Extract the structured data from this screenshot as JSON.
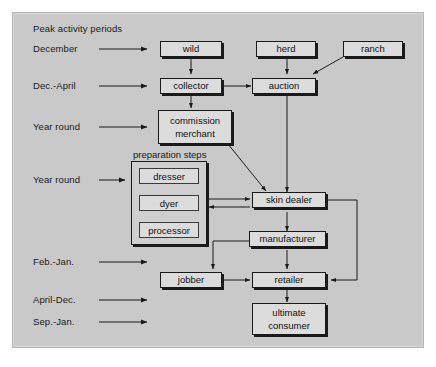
{
  "diagram": {
    "title": "Peak activity periods",
    "background_color": "#c9c9c9",
    "node_fill_color": "#dcdcdc",
    "line_color": "#1a1a1a",
    "period_labels": [
      {
        "id": "december",
        "text": "December"
      },
      {
        "id": "dec-april",
        "text": "Dec.-April"
      },
      {
        "id": "year-round-1",
        "text": "Year round"
      },
      {
        "id": "year-round-2",
        "text": "Year round"
      },
      {
        "id": "feb-jan",
        "text": "Feb.-Jan."
      },
      {
        "id": "april-dec",
        "text": "April-Dec."
      },
      {
        "id": "sep-jan",
        "text": "Sep.-Jan."
      }
    ],
    "group": {
      "caption": "preparation steps",
      "steps": [
        {
          "id": "dresser",
          "label": "dresser"
        },
        {
          "id": "dyer",
          "label": "dyer"
        },
        {
          "id": "processor",
          "label": "processor"
        }
      ]
    },
    "nodes": [
      {
        "id": "wild",
        "label": "wild"
      },
      {
        "id": "herd",
        "label": "herd"
      },
      {
        "id": "ranch",
        "label": "ranch"
      },
      {
        "id": "collector",
        "label": "collector"
      },
      {
        "id": "auction",
        "label": "auction"
      },
      {
        "id": "commission-merchant",
        "label": "commission\nmerchant",
        "line1": "commission",
        "line2": "merchant"
      },
      {
        "id": "skin-dealer",
        "label": "skin dealer"
      },
      {
        "id": "manufacturer",
        "label": "manufacturer"
      },
      {
        "id": "jobber",
        "label": "jobber"
      },
      {
        "id": "retailer",
        "label": "retailer"
      },
      {
        "id": "ultimate-consumer",
        "label": "ultimate\nconsumer",
        "line1": "ultimate",
        "line2": "consumer"
      }
    ],
    "edges": [
      {
        "from": "december-label",
        "to": "wild"
      },
      {
        "from": "dec-april-label",
        "to": "collector"
      },
      {
        "from": "year-round-1-label",
        "to": "commission-merchant"
      },
      {
        "from": "year-round-2-label",
        "to": "preparation-steps"
      },
      {
        "from": "feb-jan-label",
        "to": "jobber"
      },
      {
        "from": "april-dec-label",
        "to": "retailer-row"
      },
      {
        "from": "sep-jan-label",
        "to": "consumer-row"
      },
      {
        "from": "wild",
        "to": "collector"
      },
      {
        "from": "herd",
        "to": "auction"
      },
      {
        "from": "ranch",
        "to": "auction"
      },
      {
        "from": "collector",
        "to": "auction"
      },
      {
        "from": "collector",
        "to": "commission-merchant"
      },
      {
        "from": "commission-merchant",
        "to": "skin-dealer"
      },
      {
        "from": "auction",
        "to": "skin-dealer"
      },
      {
        "from": "preparation-steps",
        "to": "skin-dealer"
      },
      {
        "from": "skin-dealer",
        "to": "preparation-steps"
      },
      {
        "from": "skin-dealer",
        "to": "manufacturer"
      },
      {
        "from": "skin-dealer",
        "to": "retailer"
      },
      {
        "from": "manufacturer",
        "to": "jobber"
      },
      {
        "from": "manufacturer",
        "to": "retailer"
      },
      {
        "from": "jobber",
        "to": "retailer"
      },
      {
        "from": "retailer",
        "to": "ultimate-consumer"
      }
    ]
  }
}
